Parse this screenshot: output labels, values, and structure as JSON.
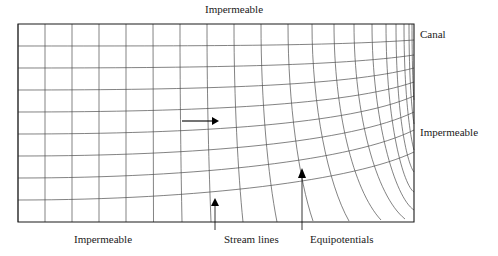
{
  "figure": {
    "type": "flow-net-diagram",
    "labels": {
      "impermeable_top": "Impermeable",
      "canal": "Canal",
      "impermeable_right": "Impermeable",
      "impermeable_bottom": "Impermeable",
      "stream_lines": "Stream lines",
      "equipotentials": "Equipotentials"
    },
    "flow_arrow": {
      "direction": "right",
      "x1": 182,
      "y1": 121,
      "x2": 216,
      "y2": 121
    },
    "domain_box": {
      "left": 18,
      "top": 24,
      "right": 414,
      "bottom": 222
    },
    "colors": {
      "net_line": "#4d4d4d",
      "frame_line": "#1a1a1a",
      "background": "#ffffff",
      "text": "#1a1a1a"
    },
    "leaders": [
      {
        "name": "stream-lines-leader",
        "x": 215,
        "y_top": 198,
        "y_bottom": 230
      },
      {
        "name": "equipotentials-leader",
        "x": 302,
        "y_top": 168,
        "y_bottom": 230
      }
    ]
  }
}
